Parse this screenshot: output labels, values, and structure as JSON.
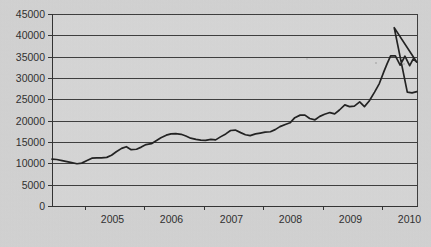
{
  "chart_data": {
    "type": "line",
    "title": "",
    "subtitle": "",
    "xlabel": "",
    "ylabel": "",
    "grid": "horizontal",
    "legend": "none",
    "ylim": [
      0,
      45000
    ],
    "ytick_step": 5000,
    "y_ticks": [
      "0",
      "5000",
      "10000",
      "15000",
      "20000",
      "25000",
      "30000",
      "35000",
      "40000",
      "45000"
    ],
    "x_ticks": [
      "2005",
      "2006",
      "2007",
      "2008",
      "2009",
      "2010"
    ],
    "xlim": [
      "2004.45",
      "2010.60"
    ],
    "line_color": "#1d1d1d",
    "plot_background": "#d2d2d2",
    "grid_color": "#3a3a3a",
    "axis_color": "#2f2f2f",
    "series": [
      {
        "name": "value",
        "x": [
          2004.45,
          2004.53,
          2004.62,
          2004.7,
          2004.78,
          2004.87,
          2004.95,
          2005.03,
          2005.12,
          2005.2,
          2005.28,
          2005.37,
          2005.45,
          2005.53,
          2005.62,
          2005.7,
          2005.78,
          2005.87,
          2005.95,
          2006.03,
          2006.12,
          2006.2,
          2006.28,
          2006.37,
          2006.45,
          2006.53,
          2006.62,
          2006.7,
          2006.78,
          2006.87,
          2006.95,
          2007.03,
          2007.12,
          2007.2,
          2007.28,
          2007.37,
          2007.45,
          2007.53,
          2007.62,
          2007.7,
          2007.78,
          2007.87,
          2007.95,
          2008.03,
          2008.12,
          2008.2,
          2008.28,
          2008.37,
          2008.45,
          2008.53,
          2008.62,
          2008.7,
          2008.78,
          2008.87,
          2008.95,
          2009.03,
          2009.12,
          2009.2,
          2009.28,
          2009.37,
          2009.45,
          2009.53,
          2009.62,
          2009.7,
          2009.78,
          2009.87,
          2009.95,
          2010.03,
          2010.08,
          2010.14,
          2010.22,
          2010.3,
          2010.38,
          2010.46,
          2010.52,
          2010.58
        ],
        "values": [
          11000,
          10900,
          10650,
          10400,
          10150,
          9900,
          10050,
          10600,
          11200,
          11300,
          11300,
          11400,
          11900,
          12700,
          13500,
          13900,
          13200,
          13300,
          13800,
          14400,
          14600,
          15300,
          16000,
          16600,
          16900,
          16950,
          16800,
          16400,
          15900,
          15600,
          15450,
          15400,
          15600,
          15500,
          16200,
          16900,
          17700,
          17800,
          17200,
          16700,
          16500,
          16900,
          17100,
          17300,
          17400,
          17900,
          18600,
          19100,
          19500,
          20700,
          21300,
          21300,
          20500,
          20200,
          21000,
          21500,
          21900,
          21600,
          22500,
          23700,
          23300,
          23400,
          24400,
          23300,
          24600,
          26700,
          28700,
          31600,
          33300,
          35200,
          35200,
          33000,
          35100,
          32900,
          34500,
          33700
        ],
        "peak_value": 41800,
        "end_value": 26700
      }
    ],
    "annotations": {
      "peak": {
        "x": 2010.2,
        "y": 41800
      },
      "final": {
        "x": 2010.42,
        "y": 26700
      },
      "start": {
        "x": 2004.45,
        "y": 11000
      },
      "trough": {
        "x": 2004.87,
        "y": 9900
      }
    }
  }
}
